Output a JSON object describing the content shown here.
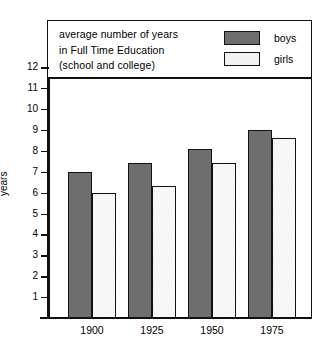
{
  "title_lines": [
    "average number of years",
    "in Full Time Education",
    "(school and college)"
  ],
  "legend": {
    "boys_label": "boys",
    "girls_label": "girls",
    "boys_color": "#6e6e6e",
    "girls_color": "#f2f2f2"
  },
  "axis": {
    "ylabel": "years",
    "yticks": [
      12,
      11,
      10,
      9,
      8,
      7,
      6,
      5,
      4,
      3,
      2,
      1
    ],
    "ylim": [
      0,
      12.8
    ]
  },
  "chart_data": {
    "type": "bar",
    "title": "average number of years in Full Time Education (school and college)",
    "xlabel": "",
    "ylabel": "years",
    "categories": [
      "1900",
      "1925",
      "1950",
      "1975"
    ],
    "series": [
      {
        "name": "boys",
        "values": [
          7.0,
          7.4,
          8.1,
          9.0
        ]
      },
      {
        "name": "girls",
        "values": [
          6.0,
          6.3,
          7.4,
          8.6
        ]
      }
    ],
    "ylim": [
      0,
      12.8
    ],
    "yticks": [
      1,
      2,
      3,
      4,
      5,
      6,
      7,
      8,
      9,
      10,
      11,
      12
    ],
    "grid": false,
    "legend_position": "top-right"
  }
}
